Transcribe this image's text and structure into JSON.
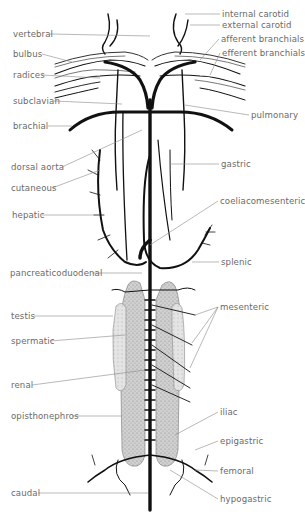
{
  "figure": {
    "labels_left": [
      {
        "id": "vertebral",
        "text": "vertebral",
        "x": 13,
        "y": 29
      },
      {
        "id": "bulbus",
        "text": "bulbus",
        "x": 13,
        "y": 49
      },
      {
        "id": "radices",
        "text": "radices",
        "x": 13,
        "y": 70
      },
      {
        "id": "subclavian",
        "text": "subclavian",
        "x": 13,
        "y": 96
      },
      {
        "id": "brachial",
        "text": "brachial",
        "x": 13,
        "y": 121
      },
      {
        "id": "dorsal-aorta",
        "text": "dorsal aorta",
        "x": 11,
        "y": 162
      },
      {
        "id": "cutaneous",
        "text": "cutaneous",
        "x": 11,
        "y": 183
      },
      {
        "id": "hepatic",
        "text": "hepatic",
        "x": 12,
        "y": 210
      },
      {
        "id": "pancreaticoduodenal",
        "text": "pancreaticoduodenal",
        "x": 10,
        "y": 268
      },
      {
        "id": "testis",
        "text": "testis",
        "x": 11,
        "y": 311
      },
      {
        "id": "spermatic",
        "text": "spermatic",
        "x": 11,
        "y": 336
      },
      {
        "id": "renal",
        "text": "renal",
        "x": 11,
        "y": 380
      },
      {
        "id": "opisthonephros",
        "text": "opisthonephros",
        "x": 11,
        "y": 411
      },
      {
        "id": "caudal",
        "text": "caudal",
        "x": 11,
        "y": 488
      }
    ],
    "labels_right": [
      {
        "id": "internal-carotid",
        "text": "internal carotid",
        "x": 222,
        "y": 9
      },
      {
        "id": "external-carotid",
        "text": "external carotid",
        "x": 222,
        "y": 20
      },
      {
        "id": "afferent-branchials",
        "text": "afferent branchials",
        "x": 221,
        "y": 34
      },
      {
        "id": "efferent-branchials",
        "text": "efferent branchials",
        "x": 222,
        "y": 48
      },
      {
        "id": "pulmonary",
        "text": "pulmonary",
        "x": 251,
        "y": 110
      },
      {
        "id": "gastric",
        "text": "gastric",
        "x": 221,
        "y": 159
      },
      {
        "id": "coeliacomesenteric",
        "text": "coeliacomesenteric",
        "x": 220,
        "y": 196
      },
      {
        "id": "splenic",
        "text": "splenic",
        "x": 221,
        "y": 257
      },
      {
        "id": "mesenteric",
        "text": "mesenteric",
        "x": 220,
        "y": 302
      },
      {
        "id": "iliac",
        "text": "iliac",
        "x": 220,
        "y": 407
      },
      {
        "id": "epigastric",
        "text": "epigastric",
        "x": 220,
        "y": 436
      },
      {
        "id": "femoral",
        "text": "femoral",
        "x": 220,
        "y": 466
      },
      {
        "id": "hypogastric",
        "text": "hypogastric",
        "x": 220,
        "y": 494
      }
    ],
    "colors": {
      "vessel": "#111111",
      "leader": "#8a8a8a",
      "label": "#6a6a6a",
      "organ_fill": "#c9c9c9",
      "testis_fill": "#dedede"
    }
  }
}
